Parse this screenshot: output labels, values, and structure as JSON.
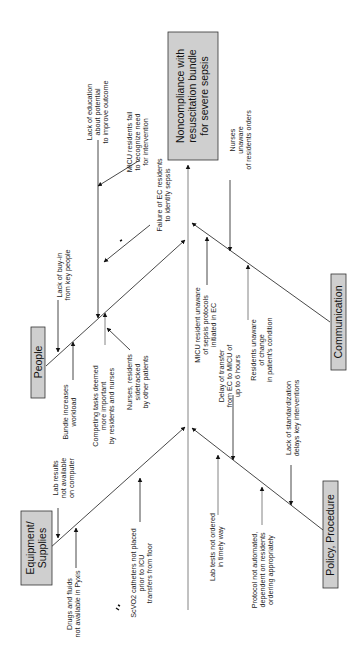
{
  "effect": {
    "lines": [
      "Noncompliance with",
      "resuscitation bundle",
      "for severe sepsis"
    ]
  },
  "categories": {
    "people": {
      "label": "People"
    },
    "equipment": {
      "lines": [
        "Equipment/",
        "Supplies"
      ]
    },
    "communication": {
      "label": "Communication"
    },
    "policy": {
      "label": "Policy, Procedure"
    }
  },
  "causes": {
    "people": [
      {
        "lines": [
          "Lack of buy-in",
          "from key people"
        ]
      },
      {
        "lines": [
          "Bundle increases",
          "workload"
        ]
      },
      {
        "lines": [
          "Competing tasks deemed",
          "more important",
          "by residents and nurses"
        ]
      },
      {
        "lines": [
          "Nurses, residents",
          "sidetracked",
          "by other patients"
        ]
      },
      {
        "lines": [
          "Lack of education",
          "about potential",
          "to improve outcome"
        ]
      },
      {
        "lines": [
          "MICU residents fail",
          "to recognize need",
          "for intervention"
        ]
      },
      {
        "lines": [
          "Failure of EC residents",
          "to identify sepsis"
        ]
      }
    ],
    "equipment": [
      {
        "lines": [
          "Lab results",
          "not available",
          "on computer"
        ]
      },
      {
        "lines": [
          "Drugs and fluids",
          "not available in Pyxis"
        ]
      },
      {
        "lines": [
          "ScVO2 catheters not placed",
          "prior to ICU",
          "transfers from floor"
        ]
      }
    ],
    "communication": [
      {
        "lines": [
          "Nurses",
          "unaware",
          "of residents orders"
        ]
      },
      {
        "lines": [
          "MICU resident unaware",
          "of sepsis protocols",
          "initiated in EC"
        ]
      },
      {
        "lines": [
          "Residents unaware",
          "of change",
          "in patient's condition"
        ]
      }
    ],
    "policy": [
      {
        "lines": [
          "Delay of transfer",
          "from EC to MICU of",
          "up to 6 hours"
        ]
      },
      {
        "lines": [
          "Lack of standardization",
          "delays key interventions"
        ]
      },
      {
        "lines": [
          "Lab tests not ordered",
          "in timely way"
        ]
      },
      {
        "lines": [
          "Protocol not automated,",
          "dependent on residents",
          "ordering appropriately"
        ]
      }
    ]
  },
  "colors": {
    "box_fill": "#cfcfcf",
    "line": "#333333",
    "text": "#222222"
  }
}
